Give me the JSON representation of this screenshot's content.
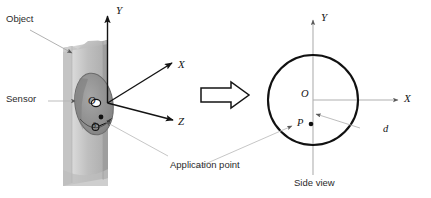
{
  "figure": {
    "background_color": "#ffffff",
    "ink_color": "#141414",
    "leader_color": "#b9b9b9",
    "object_fill_light": "#d3d3d3",
    "object_fill_mid": "#b6b6b6",
    "object_fill_dark": "#9a9a9a",
    "sensor_fill": "#8f8f8f",
    "sensor_edge": "#5c5c5c"
  },
  "left_view": {
    "object_label": "Object",
    "sensor_label": "Sensor",
    "origin_label": "O",
    "delta_label": "δ",
    "axes": [
      {
        "name": "y-axis",
        "label": "Y"
      },
      {
        "name": "x-axis",
        "label": "X"
      },
      {
        "name": "z-axis",
        "label": "Z"
      }
    ]
  },
  "transition": {
    "arrow_name": "block-arrow-right"
  },
  "right_view": {
    "caption": "Side view",
    "center_label": "O",
    "point_label": "P",
    "distance_label": "d",
    "axes": [
      {
        "name": "y-axis",
        "label": "Y"
      },
      {
        "name": "x-axis",
        "label": "X"
      }
    ]
  },
  "annotations": {
    "application_point": "Application point"
  }
}
